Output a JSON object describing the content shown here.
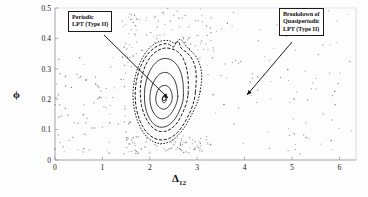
{
  "figure": {
    "type": "poincare-section",
    "background": "#fdfdfd",
    "axis_color": "#9a9a9a",
    "contour_color": "#1a1a1a",
    "scatter_color": "#6e6e6e"
  },
  "annotations": [
    {
      "name": "periodic-lpt-callout",
      "lines": [
        "Periodic",
        "LPT (Type II)"
      ],
      "box": {
        "x": 68,
        "y": 11,
        "w": 64,
        "h": 22
      },
      "arrow": {
        "x1": 104,
        "y1": 35,
        "x2": 168,
        "y2": 98
      }
    },
    {
      "name": "breakdown-quasiperiodic-callout",
      "lines": [
        "Breakdown of",
        "Quasiperiodic",
        "LPT (Type II)"
      ],
      "box": {
        "x": 279,
        "y": 8,
        "w": 72,
        "h": 30
      },
      "arrow": {
        "x1": 292,
        "y1": 42,
        "x2": 247,
        "y2": 95
      }
    }
  ],
  "chart_data": {
    "type": "scatter",
    "title": "",
    "xlabel": "Δ",
    "xlabel_sub": "12",
    "ylabel": "ϕ",
    "xlim": [
      0,
      6.35
    ],
    "ylim": [
      0,
      0.5
    ],
    "xticks": [
      0,
      1,
      2,
      3,
      4,
      5,
      6
    ],
    "xticklabels": [
      "0",
      "1",
      "2",
      "3",
      "4",
      "5",
      "6"
    ],
    "yticks": [
      0,
      0.1,
      0.2,
      0.3,
      0.4,
      0.5
    ],
    "yticklabels": [
      "0",
      "0.1",
      "0.2",
      "0.3",
      "0.4",
      "0.5"
    ],
    "grid": false,
    "legend": "none",
    "series": [
      {
        "name": "Periodic LPT (Type II) fixed point",
        "kind": "marker",
        "style": "small-open-circle",
        "x": [
          2.3
        ],
        "y": [
          0.202
        ]
      },
      {
        "name": "Quasiperiodic LPT invariant curves",
        "kind": "closed-contours",
        "note": "nested closed orbits about the Type II periodic point; outer curves drawn dashed/dotted",
        "contours": [
          {
            "level": 1,
            "linestyle": "solid",
            "cx": 2.3,
            "cy": 0.202,
            "radii": [
              0.055,
              0.012
            ],
            "points": [
              [
                2.355,
                0.202
              ],
              [
                2.348,
                0.208
              ],
              [
                2.33,
                0.212
              ],
              [
                2.308,
                0.213
              ],
              [
                2.286,
                0.21
              ],
              [
                2.27,
                0.204
              ],
              [
                2.264,
                0.198
              ],
              [
                2.27,
                0.192
              ],
              [
                2.288,
                0.189
              ],
              [
                2.31,
                0.189
              ],
              [
                2.332,
                0.192
              ],
              [
                2.348,
                0.197
              ],
              [
                2.355,
                0.202
              ]
            ]
          },
          {
            "level": 2,
            "linestyle": "solid",
            "cx": 2.3,
            "cy": 0.205,
            "radii": [
              0.175,
              0.04
            ],
            "points": [
              [
                2.475,
                0.205
              ],
              [
                2.46,
                0.222
              ],
              [
                2.42,
                0.236
              ],
              [
                2.36,
                0.244
              ],
              [
                2.29,
                0.245
              ],
              [
                2.22,
                0.24
              ],
              [
                2.165,
                0.228
              ],
              [
                2.132,
                0.212
              ],
              [
                2.128,
                0.196
              ],
              [
                2.155,
                0.182
              ],
              [
                2.21,
                0.172
              ],
              [
                2.28,
                0.167
              ],
              [
                2.352,
                0.17
              ],
              [
                2.418,
                0.18
              ],
              [
                2.46,
                0.192
              ],
              [
                2.475,
                0.205
              ]
            ]
          },
          {
            "level": 3,
            "linestyle": "solid",
            "cx": 2.29,
            "cy": 0.208,
            "radii": [
              0.3,
              0.07
            ],
            "points": [
              [
                2.59,
                0.21
              ],
              [
                2.57,
                0.24
              ],
              [
                2.515,
                0.265
              ],
              [
                2.435,
                0.281
              ],
              [
                2.34,
                0.288
              ],
              [
                2.235,
                0.285
              ],
              [
                2.14,
                0.272
              ],
              [
                2.06,
                0.25
              ],
              [
                2.01,
                0.222
              ],
              [
                2.005,
                0.192
              ],
              [
                2.048,
                0.165
              ],
              [
                2.125,
                0.146
              ],
              [
                2.225,
                0.136
              ],
              [
                2.33,
                0.138
              ],
              [
                2.432,
                0.15
              ],
              [
                2.516,
                0.17
              ],
              [
                2.57,
                0.19
              ],
              [
                2.59,
                0.21
              ]
            ]
          },
          {
            "level": 4,
            "linestyle": "solid",
            "cx": 2.28,
            "cy": 0.212,
            "radii": [
              0.43,
              0.098
            ],
            "points": [
              [
                2.71,
                0.215
              ],
              [
                2.7,
                0.255
              ],
              [
                2.65,
                0.29
              ],
              [
                2.56,
                0.315
              ],
              [
                2.44,
                0.33
              ],
              [
                2.31,
                0.334
              ],
              [
                2.18,
                0.327
              ],
              [
                2.06,
                0.308
              ],
              [
                1.96,
                0.278
              ],
              [
                1.898,
                0.24
              ],
              [
                1.888,
                0.198
              ],
              [
                1.93,
                0.16
              ],
              [
                2.02,
                0.13
              ],
              [
                2.14,
                0.112
              ],
              [
                2.275,
                0.108
              ],
              [
                2.41,
                0.116
              ],
              [
                2.535,
                0.136
              ],
              [
                2.635,
                0.165
              ],
              [
                2.695,
                0.192
              ],
              [
                2.71,
                0.215
              ]
            ]
          },
          {
            "level": 5,
            "linestyle": "dashed",
            "cx": 2.27,
            "cy": 0.216,
            "radii": [
              0.54,
              0.122
            ],
            "points": [
              [
                2.81,
                0.218
              ],
              [
                2.81,
                0.262
              ],
              [
                2.775,
                0.302
              ],
              [
                2.7,
                0.335
              ],
              [
                2.59,
                0.356
              ],
              [
                2.455,
                0.366
              ],
              [
                2.312,
                0.368
              ],
              [
                2.168,
                0.36
              ],
              [
                2.03,
                0.342
              ],
              [
                1.912,
                0.312
              ],
              [
                1.83,
                0.272
              ],
              [
                1.8,
                0.226
              ],
              [
                1.825,
                0.18
              ],
              [
                1.905,
                0.142
              ],
              [
                2.025,
                0.112
              ],
              [
                2.165,
                0.096
              ],
              [
                2.312,
                0.094
              ],
              [
                2.458,
                0.104
              ],
              [
                2.592,
                0.126
              ],
              [
                2.7,
                0.158
              ],
              [
                2.775,
                0.188
              ],
              [
                2.81,
                0.218
              ]
            ]
          },
          {
            "level": 6,
            "linestyle": "dashed",
            "cx": 2.26,
            "cy": 0.22,
            "radii": [
              0.7,
              0.15
            ],
            "points": [
              [
                2.96,
                0.222
              ],
              [
                2.98,
                0.262
              ],
              [
                2.965,
                0.3
              ],
              [
                2.9,
                0.33
              ],
              [
                2.79,
                0.352
              ],
              [
                2.66,
                0.368
              ],
              [
                2.62,
                0.385
              ],
              [
                2.56,
                0.388
              ],
              [
                2.5,
                0.372
              ],
              [
                2.38,
                0.382
              ],
              [
                2.24,
                0.38
              ],
              [
                2.09,
                0.368
              ],
              [
                1.945,
                0.346
              ],
              [
                1.82,
                0.312
              ],
              [
                1.728,
                0.268
              ],
              [
                1.692,
                0.22
              ],
              [
                1.715,
                0.17
              ],
              [
                1.8,
                0.126
              ],
              [
                1.93,
                0.092
              ],
              [
                2.09,
                0.072
              ],
              [
                2.255,
                0.066
              ],
              [
                2.42,
                0.072
              ],
              [
                2.58,
                0.09
              ],
              [
                2.73,
                0.122
              ],
              [
                2.86,
                0.162
              ],
              [
                2.935,
                0.196
              ],
              [
                2.96,
                0.222
              ]
            ]
          },
          {
            "level": 7,
            "linestyle": "dotted",
            "cx": 2.25,
            "cy": 0.222,
            "radii": [
              0.8,
              0.168
            ],
            "points": [
              [
                3.06,
                0.224
              ],
              [
                3.09,
                0.258
              ],
              [
                3.088,
                0.292
              ],
              [
                3.035,
                0.322
              ],
              [
                2.94,
                0.348
              ],
              [
                2.8,
                0.368
              ],
              [
                2.7,
                0.39
              ],
              [
                2.62,
                0.396
              ],
              [
                2.545,
                0.382
              ],
              [
                2.42,
                0.392
              ],
              [
                2.26,
                0.392
              ],
              [
                2.1,
                0.382
              ],
              [
                1.945,
                0.36
              ],
              [
                1.808,
                0.325
              ],
              [
                1.7,
                0.28
              ],
              [
                1.648,
                0.228
              ],
              [
                1.665,
                0.175
              ],
              [
                1.75,
                0.124
              ],
              [
                1.885,
                0.086
              ],
              [
                2.055,
                0.062
              ],
              [
                2.235,
                0.054
              ],
              [
                2.415,
                0.06
              ],
              [
                2.59,
                0.08
              ],
              [
                2.76,
                0.114
              ],
              [
                2.91,
                0.158
              ],
              [
                3.015,
                0.195
              ],
              [
                3.06,
                0.224
              ]
            ]
          }
        ]
      },
      {
        "name": "Chaotic sea (Breakdown of Quasiperiodic LPT)",
        "kind": "scatter",
        "marker": "dot",
        "point_count": 360,
        "note": "irregular scattered iterates filling the region outside the invariant curves, spanning Δ_12 ≈ 0–6.3 and ϕ ≈ 0.02–0.5",
        "density_regions": [
          {
            "xrange": [
              0.0,
              1.6
            ],
            "yrange": [
              0.02,
              0.34
            ],
            "density": "medium"
          },
          {
            "xrange": [
              1.4,
              3.4
            ],
            "yrange": [
              0.3,
              0.5
            ],
            "density": "high"
          },
          {
            "xrange": [
              3.2,
              6.3
            ],
            "yrange": [
              0.02,
              0.5
            ],
            "density": "medium"
          },
          {
            "xrange": [
              1.5,
              3.3
            ],
            "yrange": [
              0.02,
              0.08
            ],
            "density": "medium"
          }
        ]
      }
    ]
  }
}
